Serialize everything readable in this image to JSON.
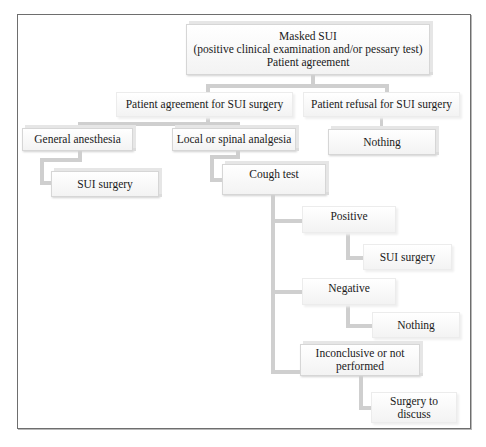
{
  "diagram": {
    "type": "flowchart",
    "root": {
      "lines": [
        "Masked SUI",
        "(positive clinical examination and/or pessary test)",
        "Patient agreement"
      ]
    },
    "level1": {
      "agreement": "Patient agreement for SUI surgery",
      "refusal": "Patient refusal for SUI surgery"
    },
    "level2": {
      "general": "General anesthesia",
      "local": "Local or spinal analgesia",
      "refusal_outcome": "Nothing"
    },
    "level3": {
      "general_outcome": "SUI surgery",
      "cough_test": "Cough test"
    },
    "cough_results": [
      {
        "label": "Positive",
        "outcome": "SUI surgery"
      },
      {
        "label": "Negative",
        "outcome": "Nothing"
      },
      {
        "label_lines": [
          "Inconclusive or not",
          "performed"
        ],
        "outcome_lines": [
          "Surgery to",
          "discuss"
        ]
      }
    ],
    "colors": {
      "connector": "#cfcfcf",
      "frame": "#6e6e6e",
      "box_bg": "#f6f6f6"
    }
  }
}
